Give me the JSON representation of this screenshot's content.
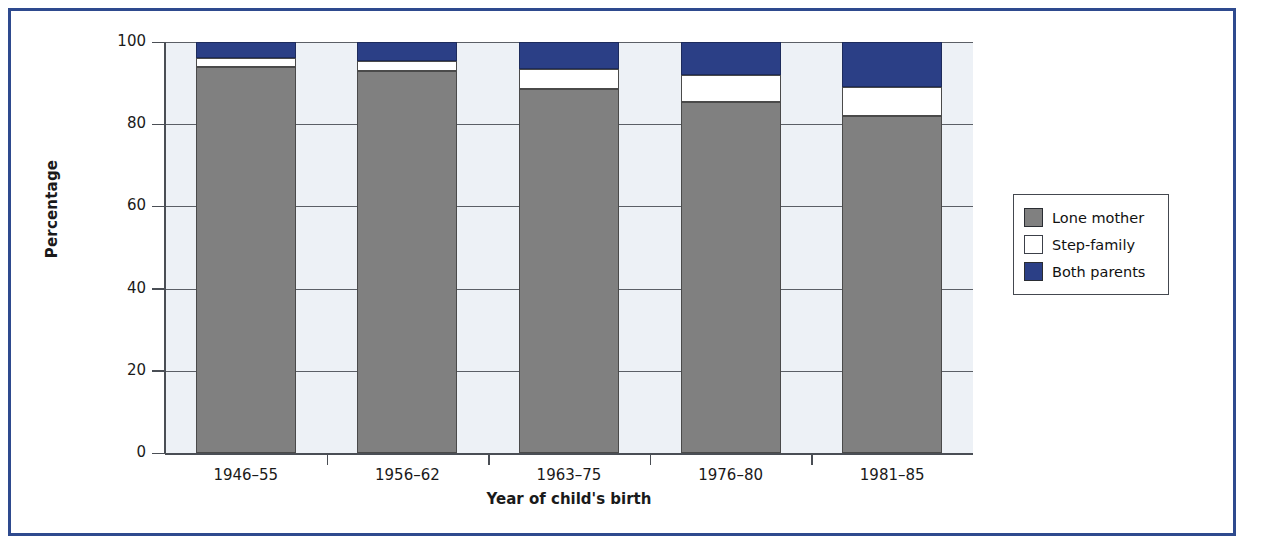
{
  "figure": {
    "frame_color": "#2e4a8e",
    "plot_background": "#edf1f6"
  },
  "legend": {
    "position": "right",
    "items": [
      {
        "label": "Lone mother",
        "color": "#808080",
        "swatch_name": "legend-swatch-lone-mother"
      },
      {
        "label": "Step-family",
        "color": "#ffffff",
        "swatch_name": "legend-swatch-step-family"
      },
      {
        "label": "Both parents",
        "color": "#2b3f86",
        "swatch_name": "legend-swatch-both-parents"
      }
    ]
  },
  "chart_data": {
    "type": "bar",
    "stacked": true,
    "title": "",
    "xlabel": "Year of child's birth",
    "ylabel": "Percentage",
    "categories": [
      "1946–55",
      "1956–62",
      "1963–75",
      "1976–80",
      "1981–85"
    ],
    "series": [
      {
        "name": "Lone mother",
        "color": "#808080",
        "values": [
          94,
          93,
          88.5,
          85.5,
          82
        ]
      },
      {
        "name": "Step-family",
        "color": "#ffffff",
        "values": [
          2,
          2.5,
          5,
          6.5,
          7
        ]
      },
      {
        "name": "Both parents",
        "color": "#2b3f86",
        "values": [
          4,
          4.5,
          6.5,
          8,
          11
        ]
      }
    ],
    "ylim": [
      0,
      100
    ],
    "yticks": [
      0,
      20,
      40,
      60,
      80,
      100
    ],
    "ytick_labels": [
      "0",
      "20",
      "40",
      "60",
      "80",
      "100"
    ],
    "grid": "horizontal",
    "legend_position": "right"
  }
}
